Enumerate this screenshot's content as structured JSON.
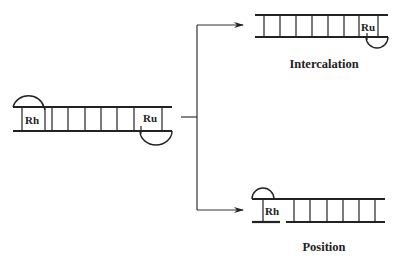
{
  "diagram": {
    "type": "DNA binding mechanism schematic",
    "colors": {
      "ink": "#222222",
      "background": "#ffffff"
    },
    "left_duplex": {
      "metals": [
        {
          "label": "Rh",
          "position": "top-left, metallointercalator stacked"
        },
        {
          "label": "Ru",
          "position": "bottom-right, metallointercalator stacked"
        }
      ]
    },
    "branches": [
      {
        "label": "Intercalation",
        "duplex_metals": [
          {
            "label": "Ru",
            "position": "bottom-right"
          }
        ]
      },
      {
        "label": "Position",
        "duplex_metals": [
          {
            "label": "Rh",
            "position": "top-left, at strand break"
          }
        ]
      }
    ]
  }
}
